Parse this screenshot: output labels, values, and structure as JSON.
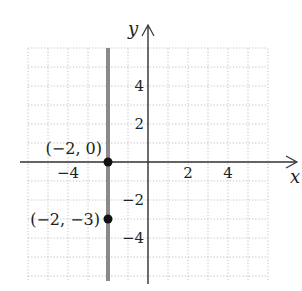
{
  "chart_data": {
    "type": "line",
    "title": "",
    "xlabel": "x",
    "ylabel": "y",
    "xlim": [
      -6,
      6
    ],
    "ylim": [
      -6,
      6
    ],
    "grid": true,
    "x_ticks": [
      {
        "value": -4,
        "label": "−4"
      },
      {
        "value": 2,
        "label": "2"
      },
      {
        "value": 4,
        "label": "4"
      }
    ],
    "y_ticks": [
      {
        "value": 4,
        "label": "4"
      },
      {
        "value": 2,
        "label": "2"
      },
      {
        "value": -2,
        "label": "−2"
      },
      {
        "value": -4,
        "label": "−4"
      }
    ],
    "series": [
      {
        "name": "x = -2",
        "kind": "vertical-line",
        "x": -2,
        "color": "#8a8a8a"
      }
    ],
    "points": [
      {
        "x": -2,
        "y": 0,
        "label": "(−2, 0)"
      },
      {
        "x": -2,
        "y": -3,
        "label": "(−2, −3)"
      }
    ],
    "colors": {
      "axis": "#333333",
      "grid": "#b0b0b0",
      "line": "#8a8a8a",
      "point": "#111111"
    }
  }
}
